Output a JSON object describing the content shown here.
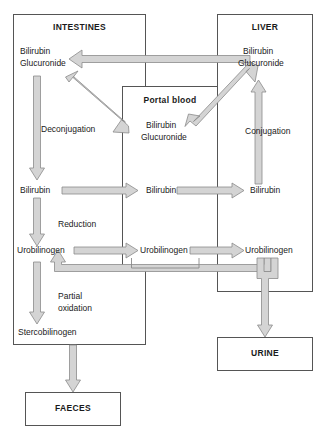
{
  "diagram": {
    "colors": {
      "box_stroke": "#555555",
      "arrow_fill": "#d4d4d4",
      "arrow_stroke": "#8a8a8a",
      "text": "#1a1a1a",
      "background": "#ffffff"
    }
  },
  "compartments": {
    "intestines": {
      "label": "INTESTINES"
    },
    "liver": {
      "label": "LIVER"
    },
    "portal_blood": {
      "label": "Portal blood"
    },
    "urine": {
      "label": "URINE"
    },
    "faeces": {
      "label": "FAECES"
    }
  },
  "metabolites": {
    "intestines": {
      "bilirubin_glucuronide_line1": "Bilirubin",
      "bilirubin_glucuronide_line2": "Glucuronide",
      "bilirubin": "Bilirubin",
      "urobilinogen": "Urobilinogen",
      "stercobilinogen": "Stercobilinogen"
    },
    "portal_blood": {
      "bilirubin_glucuronide_line1": "Bilirubin",
      "bilirubin_glucuronide_line2": "Glucuronide",
      "bilirubin": "Bilirubin",
      "urobilinogen": "Urobilinogen"
    },
    "liver": {
      "bilirubin_glucuronide_line1": "Bilirubin",
      "bilirubin_glucuronide_line2": "Glucuronide",
      "bilirubin": "Bilirubin",
      "urobilinogen": "Urobilinogen"
    }
  },
  "processes": {
    "deconjugation": "Deconjugation",
    "conjugation": "Conjugation",
    "reduction": "Reduction",
    "partial_oxidation_line1": "Partial",
    "partial_oxidation_line2": "oxidation"
  },
  "arrows": {
    "liver_to_intestines": "bilirubin-glucuronide-secretion-arrow",
    "intestines_to_portal": "bilirubin-glucuronide-uptake-arrow",
    "portal_to_liver": "portal-to-liver-arrow",
    "deconjugation": "deconjugation-arrow",
    "conjugation": "conjugation-arrow",
    "reduction": "reduction-arrow",
    "partial_oxidation": "partial-oxidation-arrow",
    "bilirubin_intestines_to_portal": "bilirubin-transfer-arrow-1",
    "bilirubin_portal_to_liver": "bilirubin-transfer-arrow-2",
    "urobilinogen_intestines_to_portal": "urobilinogen-transfer-arrow-1",
    "urobilinogen_portal_to_liver": "urobilinogen-transfer-arrow-2",
    "urobilinogen_recirculation": "enterohepatic-recirculation-arrow",
    "urobilinogen_to_urine": "urobilinogen-to-urine-arrow",
    "stercobilinogen_to_faeces": "stercobilinogen-to-faeces-arrow"
  }
}
